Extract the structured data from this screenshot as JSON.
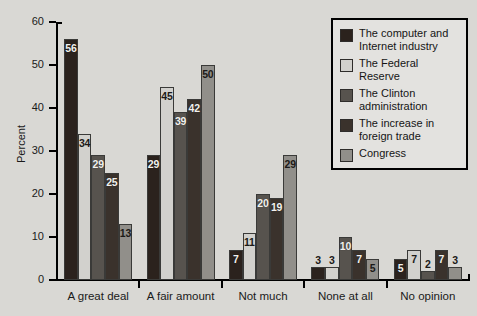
{
  "chart_data": {
    "type": "bar",
    "title": "",
    "xlabel": "",
    "ylabel": "Percent",
    "ylim": [
      0,
      60
    ],
    "yticks": [
      0,
      10,
      20,
      30,
      40,
      50,
      60
    ],
    "grid": false,
    "legend_position": "top-right",
    "categories": [
      "A great deal",
      "A fair amount",
      "Not much",
      "None at all",
      "No opinion"
    ],
    "series": [
      {
        "name": "The computer and\nInternet industry",
        "color": "#2b221d",
        "values": [
          56,
          29,
          7,
          3,
          5
        ]
      },
      {
        "name": "The Federal\nReserve",
        "color": "#d2d1cd",
        "values": [
          34,
          45,
          11,
          3,
          7
        ]
      },
      {
        "name": "The Clinton\nadministration",
        "color": "#57534e",
        "values": [
          29,
          39,
          20,
          10,
          2
        ]
      },
      {
        "name": "The increase in\nforeign trade",
        "color": "#3a322c",
        "values": [
          25,
          42,
          19,
          7,
          7
        ]
      },
      {
        "name": "Congress",
        "color": "#918f8a",
        "values": [
          13,
          50,
          29,
          5,
          3
        ]
      }
    ]
  }
}
